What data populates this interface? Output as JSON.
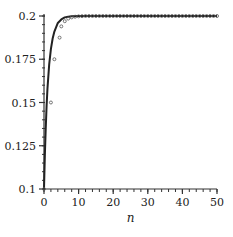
{
  "chart_data": {
    "type": "line",
    "title": "",
    "xlabel": "n",
    "ylabel": "",
    "xlim": [
      0,
      50
    ],
    "ylim": [
      0.1,
      0.2
    ],
    "grid": false,
    "legend": null,
    "x_ticks": [
      0,
      10,
      20,
      30,
      40,
      50
    ],
    "x_tick_labels": [
      "0",
      "10",
      "20",
      "30",
      "40",
      "50"
    ],
    "y_ticks": [
      0.1,
      0.125,
      0.15,
      0.175,
      0.2
    ],
    "y_tick_labels": [
      "0.1",
      "0.125",
      "0.15",
      "0.175",
      "0.2"
    ],
    "series": [
      {
        "name": "continuous curve",
        "style": "solid line",
        "color": "#222222",
        "x": [
          0,
          0.25,
          0.5,
          0.75,
          1,
          1.5,
          2,
          2.5,
          3,
          4,
          5,
          6,
          7,
          8,
          10,
          15,
          20,
          30,
          40,
          50
        ],
        "values": [
          0.1,
          0.12,
          0.135,
          0.148,
          0.158,
          0.172,
          0.181,
          0.187,
          0.191,
          0.196,
          0.198,
          0.1992,
          0.1996,
          0.1998,
          0.2,
          0.2,
          0.2,
          0.2,
          0.2,
          0.2
        ]
      },
      {
        "name": "discrete points",
        "style": "markers",
        "color": "#444444",
        "x": [
          0,
          2,
          3,
          4.5,
          5,
          6,
          7,
          8,
          9,
          10,
          11,
          12,
          13,
          14,
          15,
          16,
          17,
          18,
          19,
          20,
          21,
          22,
          23,
          24,
          25,
          26,
          27,
          28,
          29,
          30,
          31,
          32,
          33,
          34,
          35,
          36,
          37,
          38,
          39,
          40,
          41,
          42,
          43,
          44,
          45,
          46,
          47,
          48,
          49,
          50
        ],
        "values": [
          0.1,
          0.15,
          0.175,
          0.1875,
          0.194,
          0.197,
          0.1985,
          0.1992,
          0.1996,
          0.1998,
          0.1999,
          0.2,
          0.2,
          0.2,
          0.2,
          0.2,
          0.2,
          0.2,
          0.2,
          0.2,
          0.2,
          0.2,
          0.2,
          0.2,
          0.2,
          0.2,
          0.2,
          0.2,
          0.2,
          0.2,
          0.2,
          0.2,
          0.2,
          0.2,
          0.2,
          0.2,
          0.2,
          0.2,
          0.2,
          0.2,
          0.2,
          0.2,
          0.2,
          0.2,
          0.2,
          0.2,
          0.2,
          0.2,
          0.2,
          0.2
        ]
      }
    ]
  },
  "layout": {
    "plot_left_px": 44,
    "plot_right_px": 217,
    "plot_top_px": 16,
    "plot_bottom_px": 189
  }
}
